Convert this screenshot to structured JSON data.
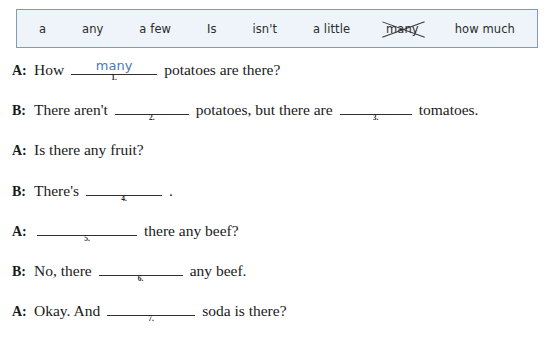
{
  "word_bank": {
    "words": [
      {
        "text": "a",
        "struck_out": false
      },
      {
        "text": "any",
        "struck_out": false
      },
      {
        "text": "a few",
        "struck_out": false
      },
      {
        "text": "Is",
        "struck_out": false
      },
      {
        "text": "isn't",
        "struck_out": false
      },
      {
        "text": "a little",
        "struck_out": false
      },
      {
        "text": "many",
        "struck_out": true
      },
      {
        "text": "how much",
        "struck_out": false
      }
    ],
    "border_color": "#7d9cc4",
    "fill_color": "#eef4f9"
  },
  "handwriting_color": "#4a7ab8",
  "dialogue": [
    {
      "speaker": "A:",
      "before": "How",
      "blank_number": "1.",
      "answer": "many",
      "after": "potatoes are there?"
    },
    {
      "speaker": "B:",
      "before": "There aren't",
      "blank_number": "2.",
      "answer": "",
      "middle": "potatoes, but there are",
      "blank_number_2": "3.",
      "answer_2": "",
      "after": "tomatoes."
    },
    {
      "speaker": "A:",
      "before": "Is there any fruit?",
      "blank_number": "",
      "answer": "",
      "after": ""
    },
    {
      "speaker": "B:",
      "before": "There's",
      "blank_number": "4.",
      "answer": "",
      "after": "."
    },
    {
      "speaker": "A:",
      "before": "",
      "blank_number": "5.",
      "answer": "",
      "after": "there any beef?"
    },
    {
      "speaker": "B:",
      "before": "No, there",
      "blank_number": "6.",
      "answer": "",
      "after": "any beef."
    },
    {
      "speaker": "A:",
      "before": "Okay.  And",
      "blank_number": "7.",
      "answer": "",
      "after": "soda is there?"
    }
  ]
}
